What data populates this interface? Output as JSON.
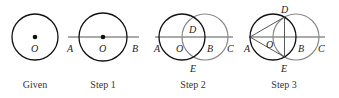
{
  "panels": [
    {
      "caption": "Given",
      "points": {
        "O": "O"
      }
    },
    {
      "caption": "Step 1",
      "points": {
        "A": "A",
        "O": "O",
        "B": "B"
      }
    },
    {
      "caption": "Step 2",
      "points": {
        "A": "A",
        "O": "O",
        "B": "B",
        "C": "C",
        "D": "D",
        "E": "E"
      }
    },
    {
      "caption": "Step 3",
      "points": {
        "A": "A",
        "O": "O",
        "B": "B",
        "C": "C",
        "D": "D",
        "E": "E"
      }
    }
  ],
  "colors": {
    "primary_stroke": "#111111",
    "secondary_stroke": "#8a8a8a",
    "line": "#444444"
  }
}
